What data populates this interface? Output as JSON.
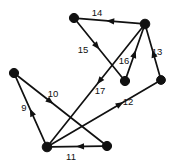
{
  "figure": {
    "type": "directed-graph-diagram",
    "width": 178,
    "height": 163,
    "background_color": "#ffffff",
    "ink_color": "#111111"
  },
  "chart_data": {
    "type": "diagram",
    "title": "",
    "xlabel": "",
    "ylabel": "",
    "directed": true,
    "node_count": 7,
    "edge_count": 9,
    "nodes": [
      {
        "id": "n1",
        "name": "top-left-node",
        "x": 74,
        "y": 18,
        "radius": 4.6
      },
      {
        "id": "n2",
        "name": "top-right-node",
        "x": 145,
        "y": 24,
        "radius": 4.8
      },
      {
        "id": "n3",
        "name": "left-node",
        "x": 14,
        "y": 73,
        "radius": 4.6
      },
      {
        "id": "n4",
        "name": "middle-node",
        "x": 125,
        "y": 81,
        "radius": 4.6
      },
      {
        "id": "n5",
        "name": "right-node",
        "x": 161,
        "y": 80,
        "radius": 4.4
      },
      {
        "id": "n6",
        "name": "bottom-left-node",
        "x": 47,
        "y": 147,
        "radius": 4.8
      },
      {
        "id": "n7",
        "name": "bottom-right-node",
        "x": 107,
        "y": 146,
        "radius": 4.6
      }
    ],
    "edges": [
      {
        "id": "e14",
        "label": "14",
        "from": "n2",
        "to": "n1",
        "label_x": 97,
        "label_y": 13,
        "arrow_t": 0.55
      },
      {
        "id": "e15",
        "label": "15",
        "from": "n1",
        "to": "n4",
        "label_x": 83,
        "label_y": 50,
        "arrow_t": 0.5
      },
      {
        "id": "e16",
        "label": "16",
        "from": "n4",
        "to": "n2",
        "label_x": 124,
        "label_y": 61,
        "arrow_t": 0.55
      },
      {
        "id": "e13",
        "label": "13",
        "from": "n5",
        "to": "n2",
        "label_x": 157,
        "label_y": 52,
        "arrow_t": 0.55
      },
      {
        "id": "e17",
        "label": "17",
        "from": "n2",
        "to": "n6",
        "label_x": 100,
        "label_y": 91,
        "arrow_t": 0.49
      },
      {
        "id": "e12",
        "label": "12",
        "from": "n6",
        "to": "n5",
        "label_x": 128,
        "label_y": 102,
        "arrow_t": 0.68
      },
      {
        "id": "e9",
        "label": "9",
        "from": "n6",
        "to": "n3",
        "label_x": 24,
        "label_y": 108,
        "arrow_t": 0.52
      },
      {
        "id": "e10",
        "label": "10",
        "from": "n3",
        "to": "n7",
        "label_x": 53,
        "label_y": 94,
        "arrow_t": 0.42
      },
      {
        "id": "e11",
        "label": "11",
        "from": "n7",
        "to": "n6",
        "label_x": 71,
        "label_y": 157,
        "arrow_t": 0.52
      }
    ],
    "edge_labels": [
      "14",
      "15",
      "16",
      "13",
      "17",
      "12",
      "9",
      "10",
      "11"
    ],
    "node_labels": []
  }
}
